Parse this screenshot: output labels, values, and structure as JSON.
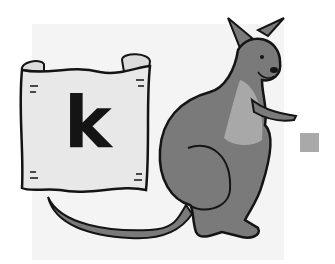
{
  "scene": {
    "description": "Cartoon kangaroo standing next to a parchment scroll showing a letter",
    "scroll_letter": "k",
    "subject": "kangaroo",
    "colors": {
      "background": "#ffffff",
      "panel": "#f4f4f4",
      "kangaroo_body": "#7a7a7a",
      "kangaroo_belly": "#a8a8a8",
      "scroll": "#e6e6e6",
      "outline": "#141414",
      "marker_square": "#a9a9a9"
    }
  },
  "marker": {
    "shape": "square"
  }
}
